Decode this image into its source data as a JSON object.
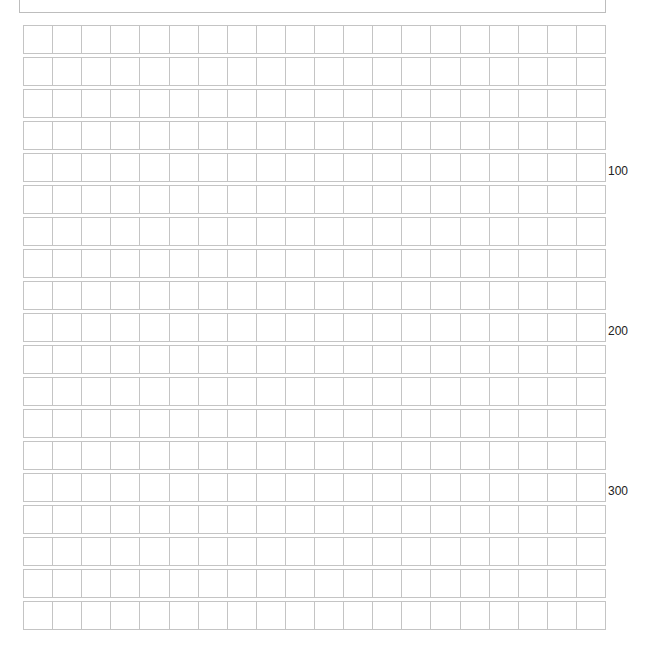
{
  "paper": {
    "type": "genkou-youshi",
    "columns": 20,
    "rows": 19,
    "line_color": "#c4c4c4",
    "cells": []
  },
  "counters": [
    {
      "label": "100",
      "after_row": 5
    },
    {
      "label": "200",
      "after_row": 10
    },
    {
      "label": "300",
      "after_row": 15
    }
  ]
}
